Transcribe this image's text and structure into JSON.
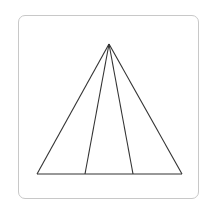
{
  "figure": {
    "type": "triangle-with-cevians",
    "stroke_color": "#333333",
    "frame_color": "#c8c8c8",
    "apex": [
      109,
      44
    ],
    "base_points": [
      [
        37,
        174
      ],
      [
        85,
        174
      ],
      [
        133,
        174
      ],
      [
        182,
        174
      ]
    ],
    "segments": [
      {
        "name": "left-side",
        "from": [
          109,
          44
        ],
        "to": [
          37,
          174
        ]
      },
      {
        "name": "inner-left-line",
        "from": [
          109,
          44
        ],
        "to": [
          85,
          174
        ]
      },
      {
        "name": "inner-right-line",
        "from": [
          109,
          44
        ],
        "to": [
          133,
          174
        ]
      },
      {
        "name": "right-side",
        "from": [
          109,
          44
        ],
        "to": [
          182,
          174
        ]
      },
      {
        "name": "base",
        "from": [
          37,
          174
        ],
        "to": [
          182,
          174
        ]
      }
    ]
  }
}
